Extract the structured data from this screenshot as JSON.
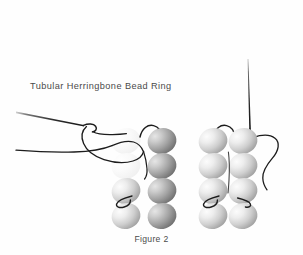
{
  "figure": {
    "title": "Tubular Herringbone Bead Ring",
    "caption": "Figure 2",
    "background_color": "#fefefe",
    "text_color": "#4a4a4a"
  },
  "illustration": {
    "description": "Beading diagram showing two columns of oval beads with thread and needles",
    "thread_color": "#1a1a1a",
    "needle_color": "#2b2b2b",
    "bead_light_top": "#f2f2f2",
    "bead_light_bottom": "#9a9a9a",
    "bead_dark_top": "#d8d8d8",
    "bead_dark_bottom": "#6e6e6e",
    "bead_ghost_color": "#f4f4f4",
    "clusters": [
      {
        "name": "left-cluster",
        "origin_x": 112,
        "origin_y": 128,
        "rows": 4,
        "cols": 2,
        "col_gap": 29,
        "row_gap": 25,
        "bead_width": 28,
        "bead_height": 25,
        "beads": [
          {
            "row": 0,
            "col": 0,
            "shade": "ghost"
          },
          {
            "row": 0,
            "col": 1,
            "shade": "dark"
          },
          {
            "row": 1,
            "col": 0,
            "shade": "ghost"
          },
          {
            "row": 1,
            "col": 1,
            "shade": "dark"
          },
          {
            "row": 2,
            "col": 0,
            "shade": "light"
          },
          {
            "row": 2,
            "col": 1,
            "shade": "dark"
          },
          {
            "row": 3,
            "col": 0,
            "shade": "light"
          },
          {
            "row": 3,
            "col": 1,
            "shade": "dark"
          }
        ]
      },
      {
        "name": "right-cluster",
        "origin_x": 199,
        "origin_y": 128,
        "rows": 4,
        "cols": 2,
        "col_gap": 29,
        "row_gap": 25,
        "bead_width": 28,
        "bead_height": 25,
        "beads": [
          {
            "row": 0,
            "col": 0,
            "shade": "light"
          },
          {
            "row": 0,
            "col": 1,
            "shade": "light"
          },
          {
            "row": 1,
            "col": 0,
            "shade": "light"
          },
          {
            "row": 1,
            "col": 1,
            "shade": "light"
          },
          {
            "row": 2,
            "col": 0,
            "shade": "light"
          },
          {
            "row": 2,
            "col": 1,
            "shade": "light"
          },
          {
            "row": 3,
            "col": 0,
            "shade": "light"
          },
          {
            "row": 3,
            "col": 1,
            "shade": "light"
          }
        ]
      }
    ],
    "needles": [
      {
        "name": "left-needle",
        "orientation": "diagonal",
        "from_x": 16,
        "from_y": 112,
        "to_x": 86,
        "to_y": 126
      },
      {
        "name": "right-needle",
        "orientation": "vertical",
        "from_x": 249,
        "from_y": 60,
        "to_x": 251,
        "to_y": 131
      }
    ],
    "threads": [
      {
        "name": "left-needle-eye-loop"
      },
      {
        "name": "left-thread-sweep"
      },
      {
        "name": "left-cluster-top-arc"
      },
      {
        "name": "left-cluster-mid-loop"
      },
      {
        "name": "right-cluster-top-arc"
      },
      {
        "name": "right-cluster-mid-loop"
      },
      {
        "name": "right-thread-tail"
      }
    ]
  }
}
